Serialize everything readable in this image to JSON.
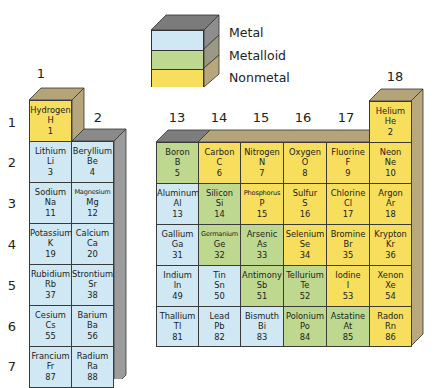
{
  "legend": {
    "items": [
      {
        "label": "Metal",
        "category": "metal",
        "color": "#cfe8f3"
      },
      {
        "label": "Metalloid",
        "category": "metalloid",
        "color": "#bed98f"
      },
      {
        "label": "Nonmetal",
        "category": "nonmetal",
        "color": "#f7de5c"
      }
    ]
  },
  "group_labels": {
    "g1": "1",
    "g2": "2",
    "g13": "13",
    "g14": "14",
    "g15": "15",
    "g16": "16",
    "g17": "17",
    "g18": "18"
  },
  "period_labels": {
    "p1": "1",
    "p2": "2",
    "p3": "3",
    "p4": "4",
    "p5": "5",
    "p6": "6",
    "p7": "7"
  },
  "elements": {
    "H": {
      "name": "Hydrogen",
      "symbol": "H",
      "number": "1"
    },
    "He": {
      "name": "Helium",
      "symbol": "He",
      "number": "2"
    },
    "Li": {
      "name": "Lithium",
      "symbol": "Li",
      "number": "3"
    },
    "Be": {
      "name": "Beryllium",
      "symbol": "Be",
      "number": "4"
    },
    "B": {
      "name": "Boron",
      "symbol": "B",
      "number": "5"
    },
    "C": {
      "name": "Carbon",
      "symbol": "C",
      "number": "6"
    },
    "N": {
      "name": "Nitrogen",
      "symbol": "N",
      "number": "7"
    },
    "O": {
      "name": "Oxygen",
      "symbol": "O",
      "number": "8"
    },
    "F": {
      "name": "Fluorine",
      "symbol": "F",
      "number": "9"
    },
    "Ne": {
      "name": "Neon",
      "symbol": "Ne",
      "number": "10"
    },
    "Na": {
      "name": "Sodium",
      "symbol": "Na",
      "number": "11"
    },
    "Mg": {
      "name": "Magnesium",
      "symbol": "Mg",
      "number": "12"
    },
    "Al": {
      "name": "Aluminum",
      "symbol": "Al",
      "number": "13"
    },
    "Si": {
      "name": "Silicon",
      "symbol": "Si",
      "number": "14"
    },
    "P": {
      "name": "Phosphorus",
      "symbol": "P",
      "number": "15"
    },
    "S": {
      "name": "Sulfur",
      "symbol": "S",
      "number": "16"
    },
    "Cl": {
      "name": "Chlorine",
      "symbol": "Cl",
      "number": "17"
    },
    "Ar": {
      "name": "Argon",
      "symbol": "Ar",
      "number": "18"
    },
    "K": {
      "name": "Potassium",
      "symbol": "K",
      "number": "19"
    },
    "Ca": {
      "name": "Calcium",
      "symbol": "Ca",
      "number": "20"
    },
    "Ga": {
      "name": "Gallium",
      "symbol": "Ga",
      "number": "31"
    },
    "Ge": {
      "name": "Germanium",
      "symbol": "Ge",
      "number": "32"
    },
    "As": {
      "name": "Arsenic",
      "symbol": "As",
      "number": "33"
    },
    "Se": {
      "name": "Selenium",
      "symbol": "Se",
      "number": "34"
    },
    "Br": {
      "name": "Bromine",
      "symbol": "Br",
      "number": "35"
    },
    "Kr": {
      "name": "Krypton",
      "symbol": "Kr",
      "number": "36"
    },
    "Rb": {
      "name": "Rubidium",
      "symbol": "Rb",
      "number": "37"
    },
    "Sr": {
      "name": "Strontium",
      "symbol": "Sr",
      "number": "38"
    },
    "In": {
      "name": "Indium",
      "symbol": "In",
      "number": "49"
    },
    "Sn": {
      "name": "Tin",
      "symbol": "Sn",
      "number": "50"
    },
    "Sb": {
      "name": "Antimony",
      "symbol": "Sb",
      "number": "51"
    },
    "Te": {
      "name": "Tellurium",
      "symbol": "Te",
      "number": "52"
    },
    "I": {
      "name": "Iodine",
      "symbol": "I",
      "number": "53"
    },
    "Xe": {
      "name": "Xenon",
      "symbol": "Xe",
      "number": "54"
    },
    "Cs": {
      "name": "Cesium",
      "symbol": "Cs",
      "number": "55"
    },
    "Ba": {
      "name": "Barium",
      "symbol": "Ba",
      "number": "56"
    },
    "Tl": {
      "name": "Thallium",
      "symbol": "Tl",
      "number": "81"
    },
    "Pb": {
      "name": "Lead",
      "symbol": "Pb",
      "number": "82"
    },
    "Bi": {
      "name": "Bismuth",
      "symbol": "Bi",
      "number": "83"
    },
    "Po": {
      "name": "Polonium",
      "symbol": "Po",
      "number": "84"
    },
    "At": {
      "name": "Astatine",
      "symbol": "At",
      "number": "85"
    },
    "Rn": {
      "name": "Radon",
      "symbol": "Rn",
      "number": "86"
    },
    "Fr": {
      "name": "Francium",
      "symbol": "Fr",
      "number": "87"
    },
    "Ra": {
      "name": "Radium",
      "symbol": "Ra",
      "number": "88"
    }
  }
}
